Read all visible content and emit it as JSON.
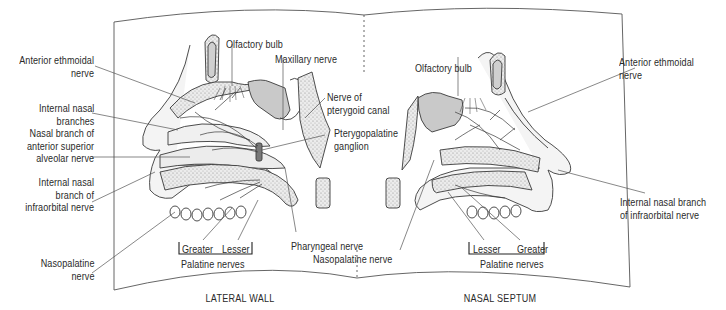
{
  "figure": {
    "panels": [
      {
        "id": "lateral-wall",
        "caption": "LATERAL WALL",
        "labels": {
          "anterior_ethmoidal": "Anterior ethmoidal\nnerve",
          "internal_nasal_branches": "Internal nasal\nbranches",
          "nasal_branch_asa": "Nasal branch of\nanterior superior\nalveolar nerve",
          "internal_nasal_infraorbital": "Internal nasal\nbranch of\ninfraorbital nerve",
          "nasopalatine": "Nasopalatine\nnerve",
          "olfactory_bulb": "Olfactory bulb",
          "maxillary_nerve": "Maxillary nerve",
          "nerve_pterygoid_canal": "Nerve of\npterygoid canal",
          "pterygopalatine_ganglion": "Pterygopalatine\nganglion",
          "pharyngeal_nerve": "Pharyngeal nerve",
          "greater": "Greater",
          "lesser": "Lesser",
          "palatine_nerves": "Palatine nerves"
        }
      },
      {
        "id": "nasal-septum",
        "caption": "NASAL SEPTUM",
        "labels": {
          "olfactory_bulb": "Olfactory bulb",
          "anterior_ethmoidal": "Anterior ethmoidal\nnerve",
          "internal_nasal_infraorbital": "Internal nasal branch\nof infraorbital nerve",
          "nasopalatine": "Nasopalatine nerve",
          "lesser": "Lesser",
          "greater": "Greater",
          "palatine_nerves": "Palatine nerves"
        }
      }
    ],
    "colors": {
      "line": "#3a3a3a",
      "bone_fill": "#e6e6e6",
      "sinus_fill": "#c9c9c9",
      "text": "#2a2a2a"
    }
  }
}
